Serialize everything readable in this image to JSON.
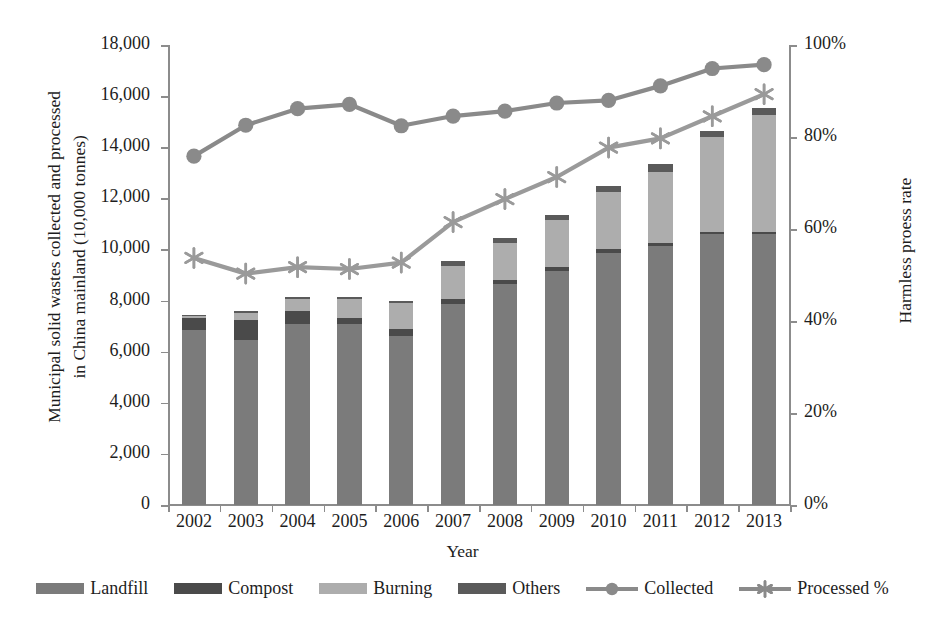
{
  "axes": {
    "y_left_title": "Municipal solid wastes collected and processed\nin China mainland (10,000 tonnes)",
    "y_right_title": "Harmless proess rate",
    "x_title": "Year",
    "y_left_ticks": [
      "0",
      "2,000",
      "4,000",
      "6,000",
      "8,000",
      "10,000",
      "12,000",
      "14,000",
      "16,000",
      "18,000"
    ],
    "y_right_ticks": [
      "0%",
      "20%",
      "40%",
      "60%",
      "80%",
      "100%"
    ]
  },
  "legend": {
    "items": [
      {
        "label": "Landfill",
        "kind": "swatch",
        "color": "#7b7b7b"
      },
      {
        "label": "Compost",
        "kind": "swatch",
        "color": "#4a4a4a"
      },
      {
        "label": "Burning",
        "kind": "swatch",
        "color": "#adadad"
      },
      {
        "label": "Others",
        "kind": "swatch",
        "color": "#5a5a5a"
      },
      {
        "label": "Collected",
        "kind": "line-circle",
        "color": "#8a8a8a"
      },
      {
        "label": "Processed %",
        "kind": "line-star",
        "color": "#8a8a8a"
      }
    ]
  },
  "colors": {
    "landfill": "#7b7b7b",
    "compost": "#4a4a4a",
    "burning": "#adadad",
    "others": "#5a5a5a",
    "collected_line": "#8a8a8a",
    "processed_line": "#9a9a9a",
    "axis": "#8c8c8c",
    "text": "#1d1d1d"
  },
  "chart_data": {
    "type": "bar",
    "subtype": "stacked-bar-with-two-lines",
    "title": "",
    "xlabel": "Year",
    "ylabel": "Municipal solid wastes collected and processed in China mainland (10,000 tonnes)",
    "y2label": "Harmless proess rate",
    "ylim": [
      0,
      18000
    ],
    "y2lim": [
      0,
      1.0
    ],
    "grid": false,
    "legend_position": "bottom",
    "categories": [
      "2002",
      "2003",
      "2004",
      "2005",
      "2006",
      "2007",
      "2008",
      "2009",
      "2010",
      "2011",
      "2012",
      "2013"
    ],
    "series": [
      {
        "name": "Landfill",
        "axis": "left",
        "type": "bar-segment",
        "values": [
          6850,
          6450,
          7100,
          7100,
          6600,
          7850,
          8650,
          9150,
          9850,
          10150,
          10600,
          10600
        ]
      },
      {
        "name": "Compost",
        "axis": "left",
        "type": "bar-segment",
        "values": [
          450,
          800,
          500,
          200,
          300,
          200,
          150,
          150,
          150,
          100,
          100,
          100
        ]
      },
      {
        "name": "Burning",
        "axis": "left",
        "type": "bar-segment",
        "values": [
          100,
          280,
          450,
          750,
          1000,
          1300,
          1450,
          1850,
          2250,
          2800,
          3700,
          4550
        ]
      },
      {
        "name": "Others",
        "axis": "left",
        "type": "bar-segment",
        "values": [
          50,
          50,
          80,
          80,
          80,
          180,
          180,
          200,
          230,
          280,
          250,
          300
        ]
      },
      {
        "name": "Collected",
        "axis": "left",
        "type": "line",
        "marker": "circle",
        "values": [
          13650,
          14860,
          15510,
          15680,
          14840,
          15220,
          15410,
          15730,
          15830,
          16400,
          17080,
          17230
        ]
      },
      {
        "name": "Processed %",
        "axis": "right",
        "type": "line",
        "marker": "star",
        "values": [
          0.537,
          0.503,
          0.517,
          0.513,
          0.527,
          0.615,
          0.665,
          0.713,
          0.777,
          0.797,
          0.845,
          0.893
        ]
      }
    ],
    "stack_totals": [
      7450,
      7580,
      8130,
      8130,
      7980,
      9530,
      10430,
      11350,
      12480,
      13330,
      14650,
      15550
    ]
  }
}
